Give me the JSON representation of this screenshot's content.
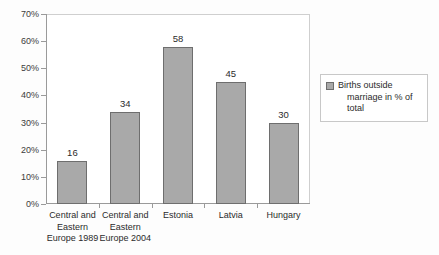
{
  "chart_data": {
    "type": "bar",
    "title": "",
    "subtitle": "",
    "xlabel": "",
    "ylabel": "",
    "categories": [
      "Central and\nEastern\nEurope 1989",
      "Central and\nEastern\nEurope 2004",
      "Estonia",
      "Latvia",
      "Hungary"
    ],
    "values": [
      16,
      34,
      58,
      45,
      30
    ],
    "data_labels": [
      "16",
      "34",
      "58",
      "45",
      "30"
    ],
    "series": [
      {
        "name": "Births outside marriage in % of total",
        "values": [
          16,
          34,
          58,
          45,
          30
        ],
        "color": "#a9a9a9"
      }
    ],
    "ylim": [
      0,
      70
    ],
    "ytick_values": [
      0,
      10,
      20,
      30,
      40,
      50,
      60,
      70
    ],
    "ytick_labels": [
      "0%",
      "10%",
      "20%",
      "30%",
      "40%",
      "50%",
      "60%",
      "70%"
    ],
    "grid": false,
    "legend_position": "right"
  },
  "legend": {
    "entries": [
      {
        "swatch_name": "legend-swatch-births-outside-marriage",
        "line1": "Births outside",
        "line2": "marriage in % of total",
        "color": "#a9a9a9"
      }
    ]
  },
  "colors": {
    "bar_fill": "#a9a9a9",
    "bar_border": "#6e6e6e",
    "axis": "#9a9a9a",
    "plot_border": "#cfcfcf",
    "text": "#2b2b2b",
    "background": "#fdfdfd"
  }
}
